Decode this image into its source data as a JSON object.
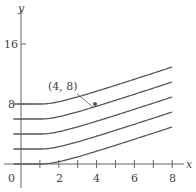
{
  "chart_data": {
    "type": "line",
    "title": "",
    "xlabel": "x",
    "ylabel": "y",
    "xlim": [
      -1.1,
      9
    ],
    "ylim": [
      -1,
      17.5
    ],
    "x_ticks": [
      1,
      2,
      3,
      4,
      5,
      6,
      7,
      8
    ],
    "x_tick_labels": [
      "0",
      "2",
      "4",
      "6",
      "8"
    ],
    "y_ticks": [
      8,
      16
    ],
    "y_tick_labels": [
      "8",
      "16"
    ],
    "origin_label": "0",
    "grid": false,
    "legend": null,
    "series": [
      {
        "name": "C=0",
        "x": [
          -0.4,
          1,
          2,
          3,
          4,
          5,
          6,
          7,
          8
        ],
        "y": [
          0,
          0,
          0.35,
          1.1,
          1.9,
          2.8,
          3.7,
          4.6,
          5.5
        ]
      },
      {
        "name": "C=2",
        "x": [
          -0.4,
          1,
          2,
          3,
          4,
          5,
          6,
          7,
          8
        ],
        "y": [
          2,
          2,
          2.35,
          3.1,
          3.9,
          4.8,
          5.7,
          6.6,
          7.5
        ]
      },
      {
        "name": "C=4",
        "x": [
          -0.4,
          1,
          2,
          3,
          4,
          5,
          6,
          7,
          8
        ],
        "y": [
          4,
          4,
          4.35,
          5.1,
          5.9,
          6.8,
          7.7,
          8.6,
          9.5
        ]
      },
      {
        "name": "C=6",
        "x": [
          -0.4,
          1,
          2,
          3,
          4,
          5,
          6,
          7,
          8
        ],
        "y": [
          6,
          6,
          6.35,
          7.1,
          7.9,
          8.8,
          9.7,
          10.6,
          11.5
        ]
      },
      {
        "name": "C=8",
        "x": [
          -0.4,
          1,
          2,
          3,
          4,
          5,
          6,
          7,
          8
        ],
        "y": [
          8,
          8,
          8.35,
          9.1,
          9.9,
          10.8,
          11.7,
          12.6,
          13.5
        ]
      }
    ],
    "annotations": [
      {
        "text": "(4, 8)",
        "point": [
          4,
          8
        ]
      }
    ]
  },
  "labels": {
    "x_axis": "x",
    "y_axis": "y",
    "origin": "0",
    "x2": "2",
    "x4": "4",
    "x6": "6",
    "x8": "8",
    "y8": "8",
    "y16": "16",
    "point": "(4, 8)"
  }
}
